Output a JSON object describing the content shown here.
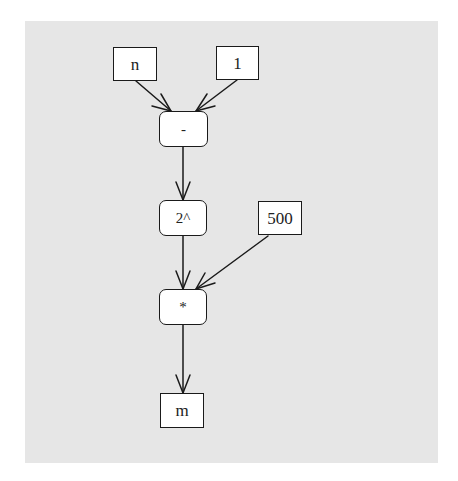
{
  "diagram": {
    "background_color": "#e6e6e6",
    "node_fill": "#ffffff",
    "stroke_color": "#1a1a1a",
    "nodes": [
      {
        "id": "n",
        "label": "n",
        "shape": "rect",
        "kind": "input"
      },
      {
        "id": "one",
        "label": "1",
        "shape": "rect",
        "kind": "constant"
      },
      {
        "id": "minus",
        "label": "-",
        "shape": "rounded-rect",
        "kind": "operator"
      },
      {
        "id": "pow2",
        "label": "2^",
        "shape": "rounded-rect",
        "kind": "operator"
      },
      {
        "id": "c500",
        "label": "500",
        "shape": "rect",
        "kind": "constant"
      },
      {
        "id": "times",
        "label": "*",
        "shape": "rounded-rect",
        "kind": "operator"
      },
      {
        "id": "m",
        "label": "m",
        "shape": "rect",
        "kind": "output"
      }
    ],
    "edges": [
      {
        "from": "n",
        "to": "minus"
      },
      {
        "from": "one",
        "to": "minus"
      },
      {
        "from": "minus",
        "to": "pow2"
      },
      {
        "from": "pow2",
        "to": "times"
      },
      {
        "from": "c500",
        "to": "times"
      },
      {
        "from": "times",
        "to": "m"
      }
    ]
  }
}
